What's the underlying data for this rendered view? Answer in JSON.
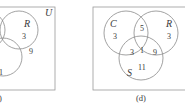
{
  "colors": {
    "line": "#8a8a8a",
    "box": "#9a9a9a",
    "text": "#3a3a3a",
    "background": "#ffffff"
  },
  "panel_c": {
    "universe_label": "U",
    "sets": {
      "R": "R"
    },
    "regions": {
      "r_only": "3",
      "r_and_s": "9",
      "s_partial": "1"
    },
    "caption": ")"
  },
  "panel_d": {
    "sets": {
      "C": "C",
      "R": "R",
      "S": "S"
    },
    "regions": {
      "c_only": "3",
      "c_and_r": "5",
      "r_only": "3",
      "c_and_s": "3",
      "c_r_s": "1",
      "r_and_s": "9",
      "s_only": "11"
    },
    "caption": "(d)"
  }
}
